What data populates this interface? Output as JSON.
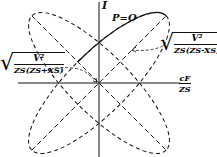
{
  "axes": {
    "vertical_label": "I",
    "horizontal_label_num": "cF",
    "horizontal_label_den": "ZS"
  },
  "labels": {
    "curve_label": "P=O",
    "upper_right_num": "V²",
    "upper_right_den": "ZS(ZS-XS)",
    "left_num": "V²",
    "left_den": "ZS(ZS+XS)"
  },
  "colors": {
    "ink": "#111111",
    "background": "#ffffff"
  }
}
